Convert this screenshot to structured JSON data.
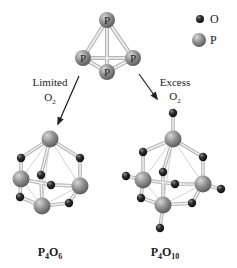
{
  "legend": {
    "items": [
      {
        "symbol": "O",
        "label": "O",
        "color": "#2b2b2b"
      },
      {
        "symbol": "P",
        "label": "P",
        "color": "#8c8c8c"
      }
    ]
  },
  "reactant": {
    "name": "P4",
    "atom_label": "P"
  },
  "arrows": [
    {
      "line1": "Limited",
      "line2_main": "O",
      "line2_sub": "2"
    },
    {
      "line1": "Excess",
      "line2_main": "O",
      "line2_sub": "2"
    }
  ],
  "products": [
    {
      "formula": {
        "p": "P",
        "p_sub": "4",
        "o": "O",
        "o_sub": "6"
      }
    },
    {
      "formula": {
        "p": "P",
        "p_sub": "4",
        "o": "O",
        "o_sub": "10"
      }
    }
  ],
  "colors": {
    "phosphorus": "#8c8c8c",
    "oxygen": "#2b2b2b",
    "bond_outer": "#b8b8b8",
    "bond_inner": "#f2f2f2",
    "arrow": "#222222"
  }
}
